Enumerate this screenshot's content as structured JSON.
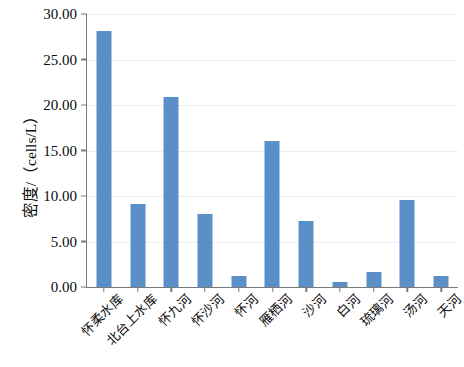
{
  "chart_data": {
    "type": "bar",
    "title": "",
    "subtitle": "",
    "xlabel": "",
    "ylabel": "密度/（cells/L）",
    "ylim": [
      0,
      30
    ],
    "ytick_labels": [
      "0.00",
      "5.00",
      "10.00",
      "15.00",
      "20.00",
      "25.00",
      "30.00"
    ],
    "ytick_values": [
      0,
      5,
      10,
      15,
      20,
      25,
      30
    ],
    "grid": "horizontal",
    "legend": null,
    "bar_color": "#5b8fc7",
    "axis_color": "#7a7a7a",
    "grid_color": "#eceff2",
    "categories": [
      "怀柔水库",
      "北台上水库",
      "怀九河",
      "怀沙河",
      "怀河",
      "雁栖河",
      "沙河",
      "白河",
      "琉璃河",
      "汤河",
      "天河"
    ],
    "values": [
      28.1,
      9.1,
      20.9,
      8.0,
      1.2,
      16.0,
      7.2,
      0.5,
      1.7,
      9.6,
      1.2
    ]
  }
}
